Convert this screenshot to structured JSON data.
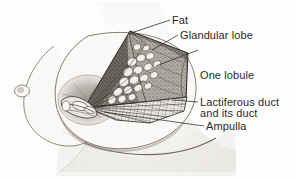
{
  "figure": {
    "background_color": "#fdfdfc",
    "ink_color": "#2a2a2a",
    "style": "pen-and-ink stipple medical illustration"
  },
  "labels": {
    "fat": "Fat",
    "glandular_lobe": "Glandular lobe",
    "one_lobule_line1": "One lobule",
    "one_lobule_line2": "and its duct",
    "lactiferous_duct": "Lactiferous duct",
    "ampulla": "Ampulla"
  },
  "anatomy": {
    "parts": [
      "far-breast-profile",
      "near-breast-profile",
      "areola",
      "nipple",
      "cutaway-wedge",
      "fat-layer",
      "glandular-lobe-mass",
      "lobule-cluster",
      "lactiferous-duct-fan",
      "ampulla",
      "chest-wall"
    ]
  },
  "leaders": {
    "fat_target": "wedge-apex",
    "glandular_lobe_target": "lobe-surface",
    "one_lobule_target": "lobule-cluster",
    "lactiferous_duct_target": "duct-fan",
    "ampulla_target": "nipple-base"
  }
}
